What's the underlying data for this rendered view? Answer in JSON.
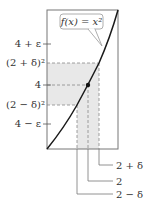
{
  "diagram": {
    "function_label": "f(x) = x²",
    "function_label_parts": {
      "f": "f",
      "x": "x",
      "eq": " = ",
      "base": "x",
      "exp": "2"
    },
    "y_ticks": [
      {
        "label": "4 + ε",
        "y": 44
      },
      {
        "label": "(2 + δ)²",
        "y": 63
      },
      {
        "label": "4",
        "y": 85
      },
      {
        "label": "(2 − δ)²",
        "y": 105
      },
      {
        "label": "4 − ε",
        "y": 124
      }
    ],
    "x_markers": [
      {
        "label": "2 + δ",
        "x": 99
      },
      {
        "label": "2",
        "x": 88
      },
      {
        "label": "2 − δ",
        "x": 77
      }
    ],
    "point": {
      "x": 2,
      "y": 4
    },
    "colors": {
      "curve": "#1a1a1a",
      "frame": "#777777",
      "dash": "#888888",
      "shade": "#e6e6e6",
      "text": "#333333"
    }
  }
}
